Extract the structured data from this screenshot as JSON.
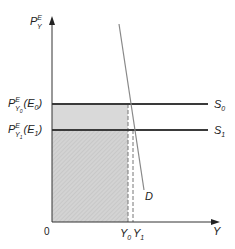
{
  "diagram": {
    "axes": {
      "y_label": {
        "main": "P",
        "sup": "E",
        "sub": "Y"
      },
      "x_label": "Y",
      "origin_label": "0"
    },
    "price_levels": [
      {
        "main": "P",
        "sup": "E",
        "sub": "Y",
        "subsub": "0",
        "point": "(E",
        "point_sub": "0",
        "point_close": ")",
        "curve": "S",
        "curve_sub": "0"
      },
      {
        "main": "P",
        "sup": "E",
        "sub": "Y",
        "subsub": "1",
        "point": "(E",
        "point_sub": "1",
        "point_close": ")",
        "curve": "S",
        "curve_sub": "1"
      }
    ],
    "demand_label": "D",
    "quantities": [
      {
        "main": "Y",
        "sub": "0"
      },
      {
        "main": "Y",
        "sub": "1"
      }
    ],
    "colors": {
      "axis": "#333333",
      "supply": "#3a3a3a",
      "demand": "#888888",
      "band_fill": "#d9d9d9",
      "rect_fill": "#cfcfcf",
      "dash": "#777777"
    }
  }
}
